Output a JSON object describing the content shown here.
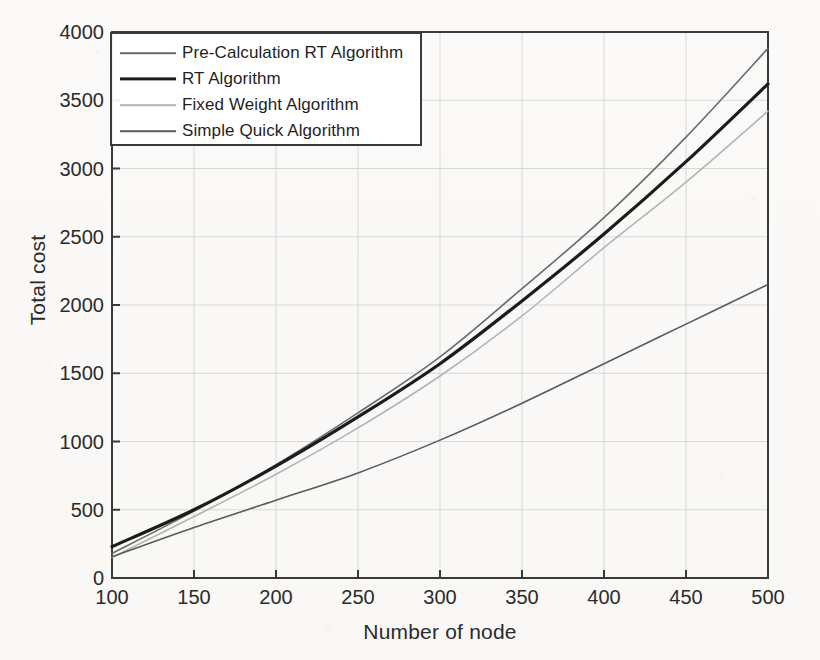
{
  "figure": {
    "background_color": "#fbfaf8",
    "axis_color": "#3a3a3a",
    "grid_color": "#d8d8d8",
    "text_color": "#2b2b2b"
  },
  "legend": {
    "position": "top-left-inside",
    "border_color": "#3a3a3a",
    "entries": [
      {
        "label": "Pre-Calculation RT Algorithm",
        "color": "#6a6a6a",
        "width": 1.6
      },
      {
        "label": "RT Algorithm",
        "color": "#1c1c1c",
        "width": 3.2
      },
      {
        "label": "Fixed Weight Algorithm",
        "color": "#b4b4b4",
        "width": 1.6
      },
      {
        "label": "Simple Quick Algorithm",
        "color": "#5a5a5a",
        "width": 1.6
      }
    ]
  },
  "chart_data": {
    "type": "line",
    "title": "",
    "xlabel": "Number of node",
    "ylabel": "Total cost",
    "xlim": [
      100,
      500
    ],
    "ylim": [
      0,
      4000
    ],
    "xticks": [
      100,
      150,
      200,
      250,
      300,
      350,
      400,
      450,
      500
    ],
    "yticks": [
      0,
      500,
      1000,
      1500,
      2000,
      2500,
      3000,
      3500,
      4000
    ],
    "xtick_labels": [
      "100",
      "150",
      "200",
      "250",
      "300",
      "350",
      "400",
      "450",
      "500"
    ],
    "ytick_labels": [
      "0",
      "500",
      "1000",
      "1500",
      "2000",
      "2500",
      "3000",
      "3500",
      "4000"
    ],
    "grid": true,
    "legend_position": "upper left",
    "x": [
      100,
      150,
      200,
      250,
      300,
      350,
      400,
      450,
      500
    ],
    "series": [
      {
        "name": "Pre-Calculation RT Algorithm",
        "color": "#6a6a6a",
        "width": 1.6,
        "values": [
          180,
          490,
          830,
          1210,
          1620,
          2120,
          2640,
          3230,
          3880
        ]
      },
      {
        "name": "RT Algorithm",
        "color": "#1c1c1c",
        "width": 3.2,
        "values": [
          230,
          500,
          820,
          1180,
          1570,
          2030,
          2520,
          3050,
          3620
        ]
      },
      {
        "name": "Fixed Weight Algorithm",
        "color": "#b4b4b4",
        "width": 1.6,
        "values": [
          150,
          450,
          760,
          1100,
          1480,
          1920,
          2420,
          2900,
          3420
        ]
      },
      {
        "name": "Simple Quick Algorithm",
        "color": "#5a5a5a",
        "width": 1.6,
        "values": [
          155,
          370,
          570,
          770,
          1010,
          1280,
          1570,
          1860,
          2150
        ]
      }
    ]
  }
}
